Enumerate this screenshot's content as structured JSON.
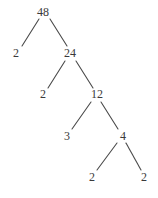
{
  "diagram": {
    "type": "factor-tree",
    "root": "48",
    "nodes": [
      {
        "id": "n48",
        "label": "48",
        "x": 43,
        "y": 12
      },
      {
        "id": "n2a",
        "label": "2",
        "x": 16,
        "y": 53
      },
      {
        "id": "n24",
        "label": "24",
        "x": 70,
        "y": 53
      },
      {
        "id": "n2b",
        "label": "2",
        "x": 43,
        "y": 94
      },
      {
        "id": "n12",
        "label": "12",
        "x": 97,
        "y": 94
      },
      {
        "id": "n3",
        "label": "3",
        "x": 67,
        "y": 136
      },
      {
        "id": "n4",
        "label": "4",
        "x": 123,
        "y": 136
      },
      {
        "id": "n2c",
        "label": "2",
        "x": 92,
        "y": 177
      },
      {
        "id": "n2d",
        "label": "2",
        "x": 144,
        "y": 177
      }
    ],
    "edges": [
      {
        "from": "n48",
        "to": "n2a",
        "x1": 39,
        "y1": 19,
        "x2": 22,
        "y2": 46
      },
      {
        "from": "n48",
        "to": "n24",
        "x1": 50,
        "y1": 19,
        "x2": 67,
        "y2": 46
      },
      {
        "from": "n24",
        "to": "n2b",
        "x1": 65,
        "y1": 61,
        "x2": 48,
        "y2": 88
      },
      {
        "from": "n24",
        "to": "n12",
        "x1": 76,
        "y1": 61,
        "x2": 93,
        "y2": 88
      },
      {
        "from": "n12",
        "to": "n3",
        "x1": 91,
        "y1": 102,
        "x2": 72,
        "y2": 129
      },
      {
        "from": "n12",
        "to": "n4",
        "x1": 101,
        "y1": 102,
        "x2": 118,
        "y2": 129
      },
      {
        "from": "n4",
        "to": "n2c",
        "x1": 117,
        "y1": 143,
        "x2": 97,
        "y2": 170
      },
      {
        "from": "n4",
        "to": "n2d",
        "x1": 126,
        "y1": 143,
        "x2": 141,
        "y2": 170
      }
    ]
  }
}
